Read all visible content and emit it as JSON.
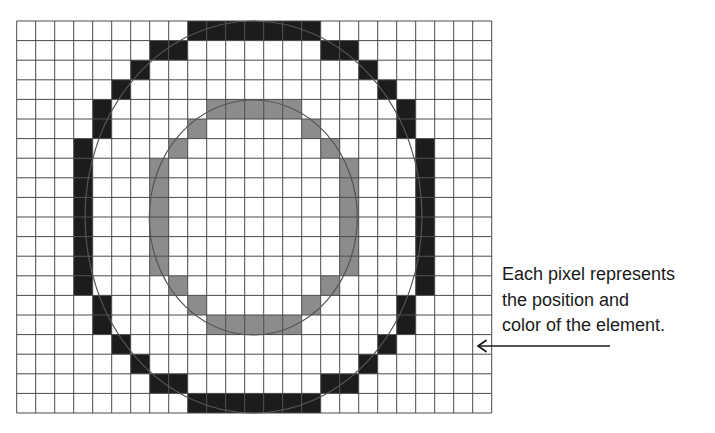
{
  "diagram": {
    "grid": {
      "columns": 25,
      "rows": 20
    },
    "colors": {
      "background": "#ffffff",
      "grid_line": "#4a4a4a",
      "outer_ring": "#1c1c1c",
      "inner_ring": "#8c8c8c",
      "ellipse_outline": "#555555",
      "arrow": "#1a1a1a"
    },
    "outer_ring_cells": [
      [
        0,
        [
          9,
          10,
          11,
          12,
          13,
          14,
          15
        ]
      ],
      [
        1,
        [
          7,
          8,
          16,
          17
        ]
      ],
      [
        2,
        [
          6,
          18
        ]
      ],
      [
        3,
        [
          5,
          19
        ]
      ],
      [
        4,
        [
          4,
          20
        ]
      ],
      [
        5,
        [
          4,
          20
        ]
      ],
      [
        6,
        [
          3,
          21
        ]
      ],
      [
        7,
        [
          3,
          21
        ]
      ],
      [
        8,
        [
          3,
          21
        ]
      ],
      [
        9,
        [
          3,
          21
        ]
      ],
      [
        10,
        [
          3,
          21
        ]
      ],
      [
        11,
        [
          3,
          21
        ]
      ],
      [
        12,
        [
          3,
          21
        ]
      ],
      [
        13,
        [
          3,
          21
        ]
      ],
      [
        14,
        [
          4,
          20
        ]
      ],
      [
        15,
        [
          4,
          20
        ]
      ],
      [
        16,
        [
          5,
          19
        ]
      ],
      [
        17,
        [
          6,
          18
        ]
      ],
      [
        18,
        [
          7,
          8,
          16,
          17
        ]
      ],
      [
        19,
        [
          9,
          10,
          11,
          12,
          13,
          14,
          15
        ]
      ]
    ],
    "inner_ring_cells": [
      [
        4,
        [
          10,
          11,
          12,
          13,
          14
        ]
      ],
      [
        5,
        [
          9,
          15
        ]
      ],
      [
        6,
        [
          8,
          16
        ]
      ],
      [
        7,
        [
          7,
          17
        ]
      ],
      [
        8,
        [
          7,
          17
        ]
      ],
      [
        9,
        [
          7,
          17
        ]
      ],
      [
        10,
        [
          7,
          17
        ]
      ],
      [
        11,
        [
          7,
          17
        ]
      ],
      [
        12,
        [
          7,
          17
        ]
      ],
      [
        13,
        [
          8,
          16
        ]
      ],
      [
        14,
        [
          9,
          15
        ]
      ],
      [
        15,
        [
          10,
          11,
          12,
          13,
          14
        ]
      ]
    ],
    "caption": {
      "lines": [
        "Each pixel represents",
        "the position and",
        "color of the element."
      ]
    }
  }
}
